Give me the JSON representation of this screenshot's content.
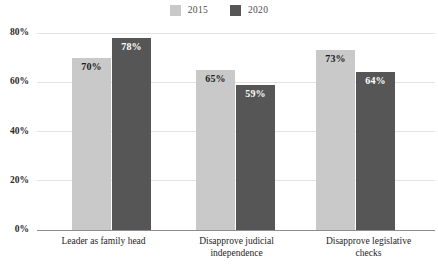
{
  "chart_data": {
    "type": "bar",
    "title": "",
    "xlabel": "",
    "ylabel": "",
    "ylim": [
      0,
      80
    ],
    "grid": true,
    "legend_position": "top-center",
    "categories": [
      "Leader as family head",
      "Disapprove judicial independence",
      "Disapprove legislative checks"
    ],
    "yticks": [
      "0%",
      "20%",
      "40%",
      "60%",
      "80%"
    ],
    "ytick_values": [
      0,
      20,
      40,
      60,
      80
    ],
    "series": [
      {
        "name": "2015",
        "color": "#c9c9c9",
        "label_color": "#1d1d1d",
        "values": [
          70,
          65,
          73
        ],
        "labels": [
          "70%",
          "65%",
          "73%"
        ]
      },
      {
        "name": "2020",
        "color": "#565656",
        "label_color": "#ffffff",
        "values": [
          78,
          59,
          64
        ],
        "labels": [
          "78%",
          "59%",
          "64%"
        ]
      }
    ]
  },
  "legend": {
    "items": [
      {
        "label": "2015",
        "color": "#c9c9c9"
      },
      {
        "label": "2020",
        "color": "#565656"
      }
    ]
  },
  "axis": {
    "ticks": [
      {
        "label": "80%",
        "value": 80
      },
      {
        "label": "60%",
        "value": 60
      },
      {
        "label": "40%",
        "value": 40
      },
      {
        "label": "20%",
        "value": 20
      },
      {
        "label": "0%",
        "value": 0
      }
    ]
  },
  "categories": [
    {
      "line1": "Leader as family head",
      "line2": ""
    },
    {
      "line1": "Disapprove judicial",
      "line2": "independence"
    },
    {
      "line1": "Disapprove legislative",
      "line2": "checks"
    }
  ],
  "bars": [
    {
      "group": 0,
      "series": "2015",
      "label": "70%"
    },
    {
      "group": 0,
      "series": "2020",
      "label": "78%"
    },
    {
      "group": 1,
      "series": "2015",
      "label": "65%"
    },
    {
      "group": 1,
      "series": "2020",
      "label": "59%"
    },
    {
      "group": 2,
      "series": "2015",
      "label": "73%"
    },
    {
      "group": 2,
      "series": "2020",
      "label": "64%"
    }
  ]
}
